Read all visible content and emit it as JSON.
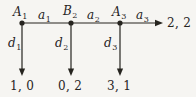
{
  "figure": {
    "kind": "game-tree",
    "nodes": [
      {
        "base": "A",
        "sub": "1"
      },
      {
        "base": "B",
        "sub": "2"
      },
      {
        "base": "A",
        "sub": "3"
      }
    ],
    "across_actions": [
      {
        "base": "a",
        "sub": "1"
      },
      {
        "base": "a",
        "sub": "2"
      },
      {
        "base": "a",
        "sub": "3"
      }
    ],
    "down_actions": [
      {
        "base": "d",
        "sub": "1"
      },
      {
        "base": "d",
        "sub": "2"
      },
      {
        "base": "d",
        "sub": "3"
      }
    ],
    "down_payoffs": [
      "1, 0",
      "0, 2",
      "3, 1"
    ],
    "across_payoff": "2, 2",
    "colors": {
      "ink": "#26241f",
      "paper": "#f6f5f2"
    }
  }
}
